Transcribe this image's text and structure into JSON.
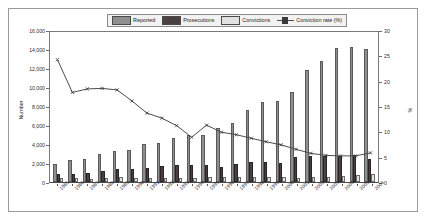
{
  "figure": {
    "ylabel_left": "Number",
    "ylabel_right": "%"
  },
  "legend": {
    "items": [
      {
        "label": "Reported",
        "type": "bar",
        "color": "#8f8f8f"
      },
      {
        "label": "Prosecutions",
        "type": "bar",
        "color": "#4b4040"
      },
      {
        "label": "Convictions",
        "type": "bar",
        "color": "#e2e2e2"
      },
      {
        "label": "Conviction rate (%)",
        "type": "line",
        "color": "#4d4d4d"
      }
    ]
  },
  "chart_data": {
    "type": "bar",
    "title": "",
    "xlabel": "",
    "ylabel": "Number",
    "ylabel_secondary": "%",
    "ylim": [
      0,
      16000
    ],
    "ylim_secondary": [
      0,
      30
    ],
    "yticks": [
      0,
      2000,
      4000,
      6000,
      8000,
      10000,
      12000,
      14000,
      16000
    ],
    "ytick_labels": [
      "0",
      "2,000",
      "4,000",
      "6,000",
      "8,000",
      "10,000",
      "12,000",
      "14,000",
      "16,000"
    ],
    "yticks_secondary": [
      0,
      5,
      10,
      15,
      20,
      25,
      30
    ],
    "ytick_labels_secondary": [
      "0",
      "5",
      "10",
      "15",
      "20",
      "25",
      "30"
    ],
    "grid": false,
    "legend_position": "top",
    "categories": [
      "1985",
      "1986",
      "1987",
      "1988",
      "1989",
      "1990",
      "1991",
      "1992",
      "1993",
      "1994",
      "1995",
      "1996",
      "1997",
      "1998",
      "1999",
      "2000",
      "2001",
      "2002",
      "2003",
      "2004",
      "2005",
      "2006"
    ],
    "series": [
      {
        "name": "Reported",
        "axis": "left",
        "color": "#8f8f8f",
        "values": [
          1850,
          2300,
          2400,
          2900,
          3300,
          3400,
          4050,
          4100,
          4650,
          4950,
          4950,
          5650,
          6200,
          7600,
          8400,
          8550,
          9450,
          11800,
          12750,
          14150,
          14250,
          13950
        ]
      },
      {
        "name": "Prosecutions",
        "axis": "left",
        "color": "#4b4040",
        "values": [
          800,
          850,
          1000,
          1150,
          1350,
          1400,
          1450,
          1700,
          1750,
          1800,
          1800,
          1550,
          1850,
          2150,
          2150,
          2000,
          2600,
          2700,
          2700,
          2700,
          2800,
          2450
        ]
      },
      {
        "name": "Convictions",
        "axis": "left",
        "color": "#e2e2e2",
        "values": [
          400,
          380,
          360,
          380,
          520,
          460,
          470,
          470,
          440,
          400,
          580,
          560,
          520,
          560,
          580,
          560,
          470,
          560,
          540,
          660,
          760,
          800
        ]
      },
      {
        "name": "Conviction rate (%)",
        "axis": "right",
        "color": "#4d4d4d",
        "values": [
          24.5,
          18.0,
          18.7,
          18.8,
          18.5,
          16.3,
          13.9,
          12.9,
          11.4,
          9.1,
          11.5,
          10.1,
          9.6,
          8.9,
          8.2,
          7.6,
          6.7,
          5.9,
          5.5,
          5.4,
          5.4,
          6.0
        ]
      }
    ]
  }
}
